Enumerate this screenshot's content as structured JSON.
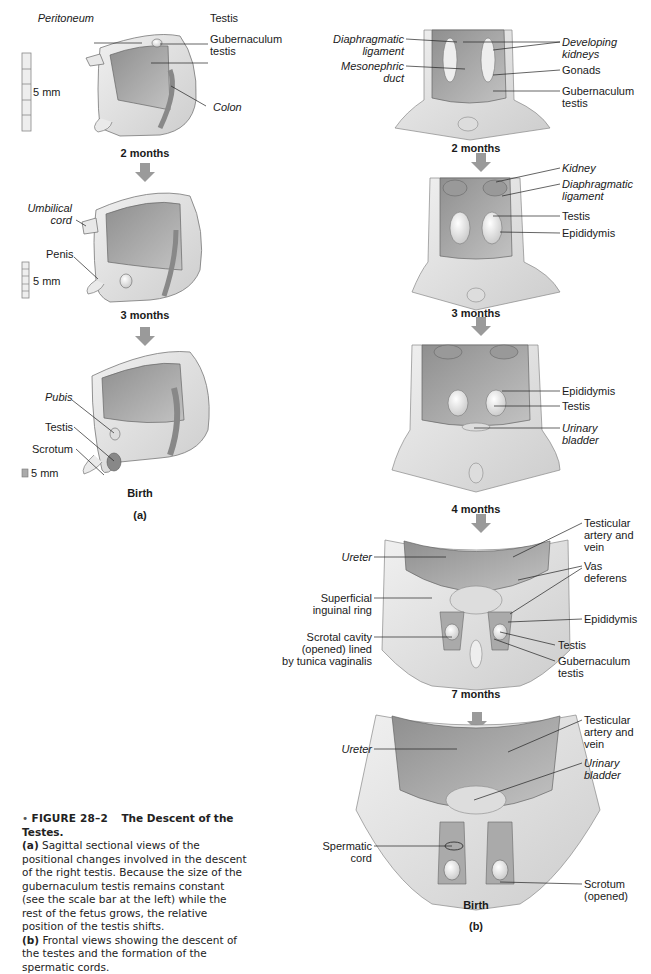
{
  "figure": {
    "number": "FIGURE 28–2",
    "title": "The Descent of the Testes.",
    "caption_a_tag": "(a)",
    "caption_a_text": " Sagittal sectional views of the positional changes involved in the descent of the right testis. Because the size of the gubernaculum testis remains constant (see the scale bar at the left) while the rest of the fetus grows, the relative position of the testis shifts.",
    "caption_b_tag": "(b)",
    "caption_b_text": " Frontal views showing the descent of the testes and the formation of the spermatic cords."
  },
  "panel_a": {
    "label": "(a)",
    "stages": [
      {
        "name": "2 months",
        "scale": "5 mm",
        "labels": {
          "peritoneum": "Peritoneum",
          "testis": "Testis",
          "gubernaculum": "Gubernaculum\ntestis",
          "colon": "Colon"
        }
      },
      {
        "name": "3 months",
        "scale": "5 mm",
        "labels": {
          "umbilical_cord": "Umbilical\ncord",
          "penis": "Penis"
        }
      },
      {
        "name": "Birth",
        "scale": "5 mm",
        "labels": {
          "pubis": "Pubis",
          "testis": "Testis",
          "scrotum": "Scrotum"
        }
      }
    ]
  },
  "panel_b": {
    "label": "(b)",
    "stages": [
      {
        "name": "2 months",
        "labels": {
          "diaphragmatic_ligament": "Diaphragmatic\nligament",
          "mesonephric_duct": "Mesonephric\nduct",
          "developing_kidneys": "Developing\nkidneys",
          "gonads": "Gonads",
          "gubernaculum": "Gubernaculum\ntestis"
        }
      },
      {
        "name": "3 months",
        "labels": {
          "kidney": "Kidney",
          "diaphragmatic_ligament": "Diaphragmatic\nligament",
          "testis": "Testis",
          "epididymis": "Epididymis"
        }
      },
      {
        "name": "4 months",
        "labels": {
          "epididymis": "Epididymis",
          "testis": "Testis",
          "urinary_bladder": "Urinary\nbladder"
        }
      },
      {
        "name": "7 months",
        "labels": {
          "ureter": "Ureter",
          "superficial_inguinal_ring": "Superficial\ninguinal ring",
          "scrotal_cavity": "Scrotal cavity\n(opened) lined\nby tunica vaginalis",
          "testicular_artery": "Testicular\nartery and\nvein",
          "vas_deferens": "Vas\ndeferens",
          "epididymis": "Epididymis",
          "testis": "Testis",
          "gubernaculum": "Gubernaculum\ntestis"
        }
      },
      {
        "name": "Birth",
        "labels": {
          "ureter": "Ureter",
          "spermatic_cord": "Spermatic\ncord",
          "testicular_artery": "Testicular\nartery and\nvein",
          "urinary_bladder": "Urinary\nbladder",
          "scrotum": "Scrotum\n(opened)"
        }
      }
    ]
  },
  "colors": {
    "skin": "#e6e6e6",
    "skin_shade": "#cfcfcf",
    "cavity": "#a9a9a9",
    "organ": "#f2f2f2",
    "arrow": "#9a9a9a",
    "leader": "#222222"
  }
}
